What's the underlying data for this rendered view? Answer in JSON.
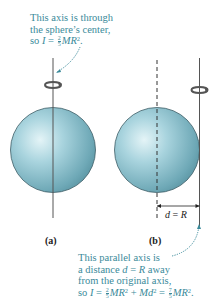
{
  "figure": {
    "panels": [
      {
        "id": "a",
        "label": "(a)",
        "axis": "through center"
      },
      {
        "id": "b",
        "label": "(b)",
        "axis": "parallel, tangent to surface"
      }
    ],
    "dimension_label": {
      "lhs": "d",
      "eq": " = ",
      "rhs": "R"
    },
    "colors": {
      "annotation": "#3a8a9a",
      "sphere_light": "#d6eef3",
      "sphere_mid": "#8ec3cf",
      "sphere_dark": "#4e8e9e",
      "axis": "#555555"
    }
  },
  "annotation_top": {
    "line1": "This axis is through",
    "line2": "the sphere’s center,",
    "line3_prefix": "so ",
    "I": "I",
    "eq": " = ",
    "frac_num": "2",
    "frac_den": "5",
    "MR": "MR",
    "exp": "2",
    "end": "."
  },
  "annotation_bottom": {
    "line1": "This parallel axis is",
    "line2_prefix": "a distance ",
    "d": "d",
    "eq": " = ",
    "R": "R",
    "line2_suffix": " away",
    "line3": "from the original axis,",
    "line4_prefix": "so ",
    "I": "I",
    "eq1": " = ",
    "frac1_num": "2",
    "frac1_den": "5",
    "MR1": "MR",
    "exp1": "2",
    "plus": " + ",
    "Md": "Md",
    "exp2": "2",
    "eq2": " = ",
    "frac2_num": "7",
    "frac2_den": "5",
    "MR2": "MR",
    "exp3": "2",
    "end": "."
  }
}
